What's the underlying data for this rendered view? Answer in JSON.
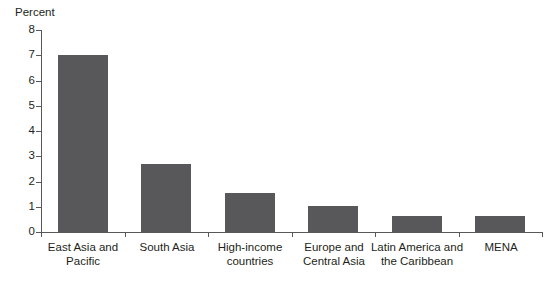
{
  "chart_data": {
    "type": "bar",
    "title": "",
    "xlabel": "",
    "ylabel": "Percent",
    "ylim": [
      0,
      8
    ],
    "yticks": [
      "0",
      "1",
      "2",
      "3",
      "4",
      "5",
      "6",
      "7",
      "8"
    ],
    "grid": false,
    "legend": false,
    "bar_color": "#58585a",
    "axis_color": "#58585a",
    "background_color": "#ffffff",
    "categories": [
      "East Asia and Pacific",
      "South Asia",
      "High-income countries",
      "Europe and Central Asia",
      "Latin America and the Caribbean",
      "MENA"
    ],
    "category_label_lines": [
      [
        "East Asia and",
        "Pacific"
      ],
      [
        "South Asia",
        ""
      ],
      [
        "High-income",
        "countries"
      ],
      [
        "Europe and",
        "Central Asia"
      ],
      [
        "Latin America and",
        "the Caribbean"
      ],
      [
        "MENA",
        ""
      ]
    ],
    "values": [
      7.0,
      2.7,
      1.55,
      1.05,
      0.65,
      0.65
    ]
  }
}
